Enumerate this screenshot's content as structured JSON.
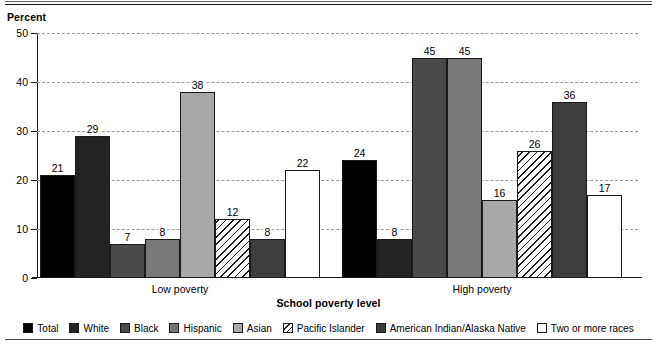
{
  "axis_note": "Percent",
  "xaxis_title": "School poverty level",
  "legend": [
    {
      "label": "Total",
      "pattern": "solid-black",
      "class": "f-total"
    },
    {
      "label": "White",
      "pattern": "solid-near-black",
      "class": "f-white"
    },
    {
      "label": "Black",
      "pattern": "solid-dark-gray",
      "class": "f-black"
    },
    {
      "label": "Hispanic",
      "pattern": "solid-mid-gray",
      "class": "f-hispanic"
    },
    {
      "label": "Asian",
      "pattern": "solid-light-gray",
      "class": "f-asian"
    },
    {
      "label": "Pacific Islander",
      "pattern": "diagonal-hatch",
      "class": "f-pacific"
    },
    {
      "label": "American Indian/Alaska Native",
      "pattern": "solid-dark-gray-2",
      "class": "f-amerind"
    },
    {
      "label": "Two or more races",
      "pattern": "white-outline",
      "class": "f-two"
    }
  ],
  "chart_data": {
    "type": "bar",
    "title": "",
    "subtitle": "",
    "xlabel": "School poverty level",
    "ylabel": "Percent",
    "ylim": [
      0,
      50
    ],
    "yticks": [
      0,
      10,
      20,
      30,
      40,
      50
    ],
    "ytick_labels": [
      "0",
      "10",
      "20",
      "30",
      "40",
      "50"
    ],
    "grid": "horizontal-dashed",
    "legend_position": "bottom",
    "categories": [
      "Low poverty",
      "High poverty"
    ],
    "series": [
      {
        "name": "Total",
        "values": [
          21,
          24
        ]
      },
      {
        "name": "White",
        "values": [
          29,
          8
        ]
      },
      {
        "name": "Black",
        "values": [
          7,
          45
        ]
      },
      {
        "name": "Hispanic",
        "values": [
          8,
          45
        ]
      },
      {
        "name": "Asian",
        "values": [
          38,
          16
        ]
      },
      {
        "name": "Pacific Islander",
        "values": [
          12,
          26
        ]
      },
      {
        "name": "American Indian/Alaska Native",
        "values": [
          8,
          36
        ]
      },
      {
        "name": "Two or more races",
        "values": [
          22,
          17
        ]
      }
    ]
  }
}
